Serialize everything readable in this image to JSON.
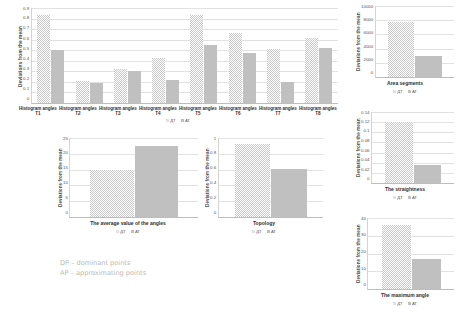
{
  "legend": {
    "dt": "ДТ",
    "at": "АТ"
  },
  "footnote": {
    "line1": "DP – dominant points",
    "line2": "AP – approximating points"
  },
  "charts": {
    "main": {
      "type": "bar",
      "title": "",
      "ylabel": "Deviations from the mean",
      "xlabel": "",
      "categories": [
        "Histogram angles T1",
        "Histogram angles T2",
        "Histogram angles T3",
        "Histogram angles T4",
        "Histogram angles T5",
        "Histogram angles T6",
        "Histogram angles T7",
        "Histogram angles T8"
      ],
      "series": [
        {
          "name": "ДТ",
          "values": [
            0.83,
            0.21,
            0.32,
            0.43,
            0.83,
            0.66,
            0.51,
            0.62
          ]
        },
        {
          "name": "АТ",
          "values": [
            0.5,
            0.19,
            0.3,
            0.22,
            0.55,
            0.47,
            0.2,
            0.52
          ]
        }
      ],
      "ylim": [
        0,
        0.9
      ],
      "yticks": [
        "0.9",
        "0.8",
        "0.7",
        "0.6",
        "0.5",
        "0.4",
        "0.3",
        "0.2",
        "0.1",
        "0"
      ],
      "grid": true,
      "legend_position": "bottom"
    },
    "area_segments": {
      "type": "bar",
      "ylabel": "Deviations from the mean",
      "categories": [
        "Area segments"
      ],
      "series": [
        {
          "name": "ДТ",
          "values": [
            7700
          ]
        },
        {
          "name": "АТ",
          "values": [
            3000
          ]
        }
      ],
      "ylim": [
        0,
        10000
      ],
      "yticks": [
        "10000",
        "8000",
        "6000",
        "4000",
        "2000",
        "0"
      ],
      "grid": true,
      "legend_position": "bottom"
    },
    "straightness": {
      "type": "bar",
      "ylabel": "Deviations from the mean",
      "categories": [
        "The straightness"
      ],
      "series": [
        {
          "name": "ДТ",
          "values": [
            0.121
          ]
        },
        {
          "name": "АТ",
          "values": [
            0.035
          ]
        }
      ],
      "ylim": [
        0,
        0.14
      ],
      "yticks": [
        "0.14",
        "0.12",
        "0.1",
        "0.08",
        "0.06",
        "0.04",
        "0.02",
        "0"
      ],
      "grid": true,
      "legend_position": "bottom"
    },
    "maximum_angle": {
      "type": "bar",
      "ylabel": "Deviations from the mean",
      "categories": [
        "The maximum angle"
      ],
      "series": [
        {
          "name": "ДТ",
          "values": [
            36
          ]
        },
        {
          "name": "АТ",
          "values": [
            17
          ]
        }
      ],
      "ylim": [
        0,
        40
      ],
      "yticks": [
        "40",
        "30",
        "20",
        "10",
        "0"
      ],
      "grid": true,
      "legend_position": "bottom"
    },
    "average_angles": {
      "type": "bar",
      "ylabel": "Deviations from the mean",
      "categories": [
        "The average value of the angles"
      ],
      "series": [
        {
          "name": "ДТ",
          "values": [
            15
          ]
        },
        {
          "name": "АТ",
          "values": [
            22.5
          ]
        }
      ],
      "ylim": [
        0,
        25
      ],
      "yticks": [
        "25",
        "20",
        "15",
        "10",
        "5",
        "0"
      ],
      "grid": true,
      "legend_position": "bottom"
    },
    "topology": {
      "type": "bar",
      "ylabel": "Deviations from the mean",
      "categories": [
        "Topology"
      ],
      "series": [
        {
          "name": "ДТ",
          "values": [
            0.93
          ]
        },
        {
          "name": "АТ",
          "values": [
            0.61
          ]
        }
      ],
      "ylim": [
        0,
        1
      ],
      "yticks": [
        "1",
        "0.8",
        "0.6",
        "0.4",
        "0.2",
        "0"
      ],
      "grid": true,
      "legend_position": "bottom"
    }
  }
}
